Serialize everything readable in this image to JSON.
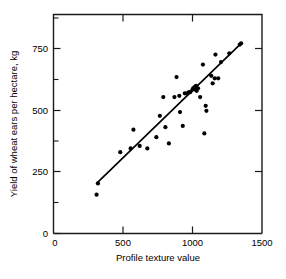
{
  "chart_data": {
    "type": "scatter",
    "title": "",
    "xlabel": "Profile texture value",
    "ylabel": "Yield of wheat ears per hectare, kg",
    "xlim": [
      0,
      1500
    ],
    "ylim": [
      0,
      875
    ],
    "xticks": [
      0,
      500,
      1000,
      1500
    ],
    "xtick_labels": [
      "0",
      "500",
      "1000",
      "1500"
    ],
    "yticks": [
      0,
      250,
      500,
      750
    ],
    "ytick_labels": [
      "0",
      "250",
      "500",
      "750"
    ],
    "y_minor_ticks": [
      125,
      375,
      625,
      875
    ],
    "grid": false,
    "legend": null,
    "marker": "filled-circle",
    "marker_color": "#000000",
    "series": [
      {
        "name": "wheat yield vs profile texture",
        "points": [
          [
            310,
            155
          ],
          [
            320,
            200
          ],
          [
            480,
            325
          ],
          [
            555,
            340
          ],
          [
            575,
            415
          ],
          [
            620,
            350
          ],
          [
            675,
            340
          ],
          [
            740,
            385
          ],
          [
            765,
            470
          ],
          [
            790,
            545
          ],
          [
            805,
            425
          ],
          [
            830,
            360
          ],
          [
            870,
            545
          ],
          [
            885,
            625
          ],
          [
            905,
            550
          ],
          [
            910,
            485
          ],
          [
            930,
            430
          ],
          [
            945,
            560
          ],
          [
            960,
            560
          ],
          [
            975,
            565
          ],
          [
            985,
            565
          ],
          [
            1000,
            575
          ],
          [
            1005,
            580
          ],
          [
            1010,
            580
          ],
          [
            1015,
            585
          ],
          [
            1020,
            575
          ],
          [
            1025,
            590
          ],
          [
            1030,
            570
          ],
          [
            1040,
            580
          ],
          [
            1055,
            545
          ],
          [
            1075,
            675
          ],
          [
            1085,
            400
          ],
          [
            1095,
            510
          ],
          [
            1100,
            490
          ],
          [
            1135,
            630
          ],
          [
            1145,
            600
          ],
          [
            1160,
            620
          ],
          [
            1165,
            715
          ],
          [
            1185,
            620
          ],
          [
            1205,
            685
          ],
          [
            1265,
            720
          ],
          [
            1340,
            755
          ],
          [
            1350,
            760
          ]
        ]
      }
    ],
    "fit_line": {
      "name": "regression-line",
      "x_start": 310,
      "y_start": 200,
      "x_end": 1350,
      "y_end": 760,
      "color": "#000000"
    }
  }
}
